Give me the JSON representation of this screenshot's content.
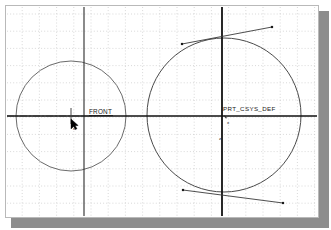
{
  "app": {
    "view_title": "Sketcher Graphics Window",
    "background_color": "#ffffff",
    "frame_color": "#b9b9b9",
    "shadow_color": "#8d8d8d"
  },
  "grid": {
    "visible": true,
    "style": "dotted",
    "spacing_px": 17.2,
    "color": "#c9c9c9",
    "origin_x": 5,
    "origin_y": 14
  },
  "geometry": {
    "entity_color": "#4a4a4a",
    "datum_color": "#1a1a1a",
    "circles": [
      {
        "name": "small-circle",
        "cx": 71,
        "cy": 116,
        "r": 55,
        "color": "#5a5a5a",
        "stroke_width": 0.9
      },
      {
        "name": "large-circle",
        "cx": 224,
        "cy": 115,
        "r": 77,
        "color": "#4a4a4a",
        "stroke_width": 1.0
      }
    ],
    "lines": [
      {
        "name": "tangent-line-top",
        "x1": 182,
        "y1": 44,
        "x2": 272,
        "y2": 27,
        "color": "#3a3a3a",
        "stroke_width": 0.9
      },
      {
        "name": "tangent-line-bottom",
        "x1": 183,
        "y1": 190,
        "x2": 283,
        "y2": 203,
        "color": "#3a3a3a",
        "stroke_width": 0.9
      }
    ],
    "endpoint_markers": [
      {
        "name": "tangent-top-start",
        "x": 182,
        "y": 44
      },
      {
        "name": "tangent-top-end",
        "x": 272,
        "y": 27
      },
      {
        "name": "tangent-bottom-start",
        "x": 183,
        "y": 190
      },
      {
        "name": "tangent-bottom-end",
        "x": 283,
        "y": 203
      }
    ]
  },
  "datums": {
    "horizontal_axis": {
      "name": "horizontal-datum-axis",
      "y": 116,
      "x1": 7,
      "x2": 317,
      "color": "#111111",
      "stroke_width": 1.6
    },
    "left_centerline": {
      "name": "left-centerline",
      "y": 116,
      "x1": 7,
      "x2": 96,
      "color": "#333333",
      "dash": "7 2 2 2"
    },
    "center_tick": {
      "name": "center-tick-mark",
      "x": 71,
      "y1": 108,
      "y2": 124
    },
    "vertical_lines": [
      {
        "name": "front-datum-plane",
        "x": 84,
        "y1": 7,
        "y2": 216,
        "color": "#2b2b2b",
        "stroke_width": 1.1
      },
      {
        "name": "right-datum-plane",
        "x": 222,
        "y1": 7,
        "y2": 216,
        "color": "#111111",
        "stroke_width": 1.8
      }
    ]
  },
  "labels": {
    "front_plane": {
      "text": "FRONT",
      "x": 89,
      "y": 114
    },
    "csys": {
      "text": "PRT_CSYS_DEF",
      "x": 223,
      "y": 111
    },
    "axis_x": {
      "text": "x",
      "x": 227,
      "y": 124
    },
    "axis_z": {
      "text": "z",
      "x": 219,
      "y": 140
    }
  },
  "cursor": {
    "name": "mouse-pointer",
    "x": 71,
    "y": 119,
    "color": "#000000",
    "snap_marker": {
      "name": "snap-indicator",
      "x": 73,
      "y": 130,
      "text": "o"
    }
  }
}
